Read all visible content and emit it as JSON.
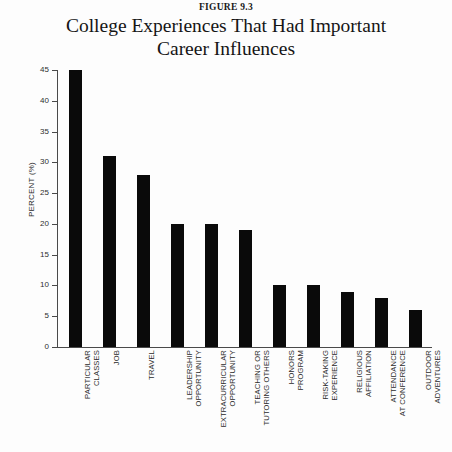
{
  "figure": {
    "number": "FIGURE 9.3",
    "title_line_1": "College Experiences That Had Important",
    "title_line_2": "Career Influences"
  },
  "colors": {
    "bar": "#0a0a0a",
    "axis": "#4a4a4a",
    "text": "#2b2b2b",
    "background": "#fdfdfd"
  },
  "chart_data": {
    "type": "bar",
    "title": "College Experiences That Had Important Career Influences",
    "subtitle": "FIGURE 9.3",
    "xlabel": "",
    "ylabel": "PERCENT (%)",
    "ylim": [
      0,
      45
    ],
    "ytick_values": [
      0,
      5,
      10,
      15,
      20,
      25,
      30,
      35,
      40,
      45
    ],
    "ytick_labels": [
      "0",
      "5",
      "10",
      "15",
      "20",
      "25",
      "30",
      "35",
      "40",
      "45"
    ],
    "grid": false,
    "legend": null,
    "categories": [
      "PARTICULAR CLASSES",
      "JOB",
      "TRAVEL",
      "LEADERSHIP OPPORTUNITY",
      "EXTRACURRICULAR OPPORTUNITY",
      "TEACHING OR TUTORING OTHERS",
      "HONORS PROGRAM",
      "RISK-TAKING EXPERIENCE",
      "RELIGIOUS AFFILIATION",
      "ATTENDANCE AT CONFERENCE",
      "OUTDOOR ADVENTURES"
    ],
    "category_lines": [
      [
        "PARTICULAR",
        "CLASSES"
      ],
      [
        "JOB"
      ],
      [
        "TRAVEL"
      ],
      [
        "LEADERSHIP",
        "OPPORTUNITY"
      ],
      [
        "EXTRACURRICULAR",
        "OPPORTUNITY"
      ],
      [
        "TEACHING OR",
        "TUTORING OTHERS"
      ],
      [
        "HONORS",
        "PROGRAM"
      ],
      [
        "RISK-TAKING",
        "EXPERIENCE"
      ],
      [
        "RELIGIOUS",
        "AFFILIATION"
      ],
      [
        "ATTENDANCE",
        "AT CONFERENCE"
      ],
      [
        "OUTDOOR",
        "ADVENTURES"
      ]
    ],
    "values": [
      45,
      31,
      28,
      20,
      20,
      19,
      10,
      10,
      9,
      8,
      6
    ]
  }
}
